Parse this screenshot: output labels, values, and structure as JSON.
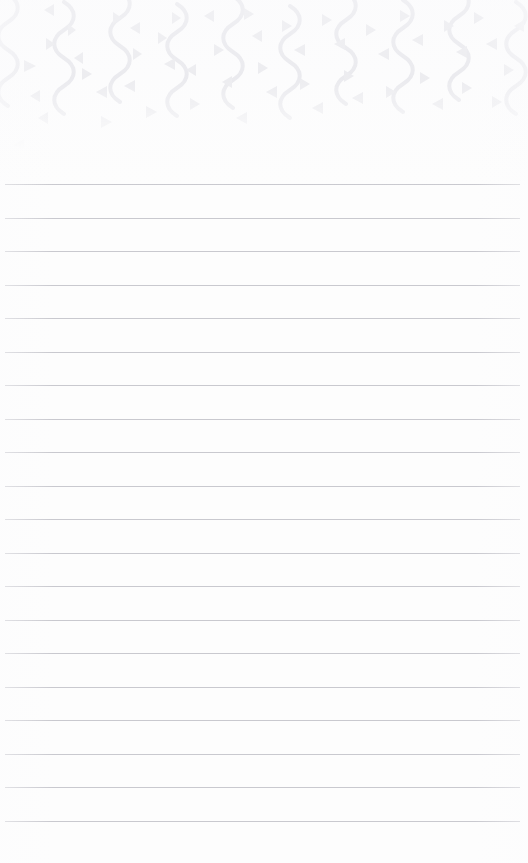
{
  "page": {
    "name": "lined-notepad-page",
    "kind": "blank-stationery-sheet",
    "width_px": 528,
    "height_px": 863,
    "background_color": "#fdfdfd",
    "text_content": ""
  },
  "decoration": {
    "name": "confetti-streamer-header",
    "motif": "party-confetti",
    "band_top_px": 0,
    "band_height_px": 150,
    "fade_out_y_px": 128,
    "element_color": "#e4e4e8",
    "element_color_light": "#ededf0",
    "streamer": {
      "icon": "wavy-streamer-icon",
      "count": 10,
      "horizontal_spacing_px": 57,
      "stroke_width_px": 4,
      "wave_amplitude_px": 11,
      "wave_period_px": 34,
      "start_x_px": 8
    },
    "triangles": {
      "icon": "confetti-triangle-icon",
      "count": 52,
      "min_size_px": 5,
      "max_size_px": 11
    }
  },
  "ruling": {
    "name": "ruled-lines",
    "line_color": "#c9c9cf",
    "line_thickness_px": 1,
    "line_count": 20,
    "first_line_y_px": 184,
    "line_spacing_px": 33.5,
    "left_margin_px": 5,
    "right_margin_px": 8
  },
  "fields": {
    "body_text": "",
    "body_placeholder": ""
  }
}
